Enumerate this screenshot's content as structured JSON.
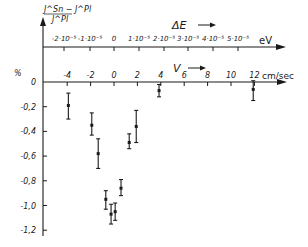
{
  "chart_data": {
    "type": "scatter",
    "title": "",
    "ylabel": {
      "numerator": "J^Sn − J^Pl",
      "denominator": "J^Pl",
      "unit": "%"
    },
    "xlabel": {
      "name": "V",
      "unit": "cm/sec"
    },
    "secondary_xlabel": {
      "name": "ΔE",
      "unit": "eV"
    },
    "ylim": [
      -1.25,
      0
    ],
    "xlim": [
      -6,
      14
    ],
    "y_ticks": [
      {
        "value": 0,
        "label": "0"
      },
      {
        "value": -0.2,
        "label": "-0,2"
      },
      {
        "value": -0.4,
        "label": "-0,4"
      },
      {
        "value": -0.6,
        "label": "-0,6"
      },
      {
        "value": -0.8,
        "label": "-0,8"
      },
      {
        "value": -1.0,
        "label": "-1,0"
      },
      {
        "value": -1.2,
        "label": "-1,2"
      }
    ],
    "x_ticks": [
      {
        "value": -4,
        "label": "-4"
      },
      {
        "value": -2,
        "label": "-2"
      },
      {
        "value": 0,
        "label": "0"
      },
      {
        "value": 2,
        "label": "2"
      },
      {
        "value": 4,
        "label": "4"
      },
      {
        "value": 6,
        "label": "6"
      },
      {
        "value": 8,
        "label": "8"
      },
      {
        "value": 10,
        "label": "10"
      },
      {
        "value": 12,
        "label": "12"
      }
    ],
    "secondary_x_ticks": [
      {
        "x_px": 64,
        "label": "-2·10⁻⁵"
      },
      {
        "x_px": 90,
        "label": "-1·10⁻⁵"
      },
      {
        "x_px": 114,
        "label": "0"
      },
      {
        "x_px": 139,
        "label": "1·10⁻⁵"
      },
      {
        "x_px": 164,
        "label": "2·10⁻⁵"
      },
      {
        "x_px": 188,
        "label": "3·10⁻⁵"
      },
      {
        "x_px": 213,
        "label": "4·10⁻⁵"
      },
      {
        "x_px": 238,
        "label": "5·10⁻⁵"
      }
    ],
    "series": [
      {
        "name": "measurements",
        "points": [
          {
            "x": -3.9,
            "y": -0.19,
            "ylow": -0.3,
            "yhigh": -0.09
          },
          {
            "x": -1.9,
            "y": -0.35,
            "ylow": -0.43,
            "yhigh": -0.25
          },
          {
            "x": -1.35,
            "y": -0.58,
            "ylow": -0.7,
            "yhigh": -0.46
          },
          {
            "x": -0.7,
            "y": -0.95,
            "ylow": -1.03,
            "yhigh": -0.88
          },
          {
            "x": -0.25,
            "y": -1.07,
            "ylow": -1.15,
            "yhigh": -0.99
          },
          {
            "x": 0.1,
            "y": -1.05,
            "ylow": -1.12,
            "yhigh": -0.98
          },
          {
            "x": 0.6,
            "y": -0.86,
            "ylow": -0.92,
            "yhigh": -0.79
          },
          {
            "x": 1.3,
            "y": -0.49,
            "ylow": -0.54,
            "yhigh": -0.42
          },
          {
            "x": 1.9,
            "y": -0.36,
            "ylow": -0.49,
            "yhigh": -0.23
          },
          {
            "x": 3.85,
            "y": -0.07,
            "ylow": -0.12,
            "yhigh": -0.02
          },
          {
            "x": 11.9,
            "y": -0.06,
            "ylow": -0.15,
            "yhigh": 0.01
          }
        ]
      }
    ],
    "grid": false,
    "legend": null
  }
}
